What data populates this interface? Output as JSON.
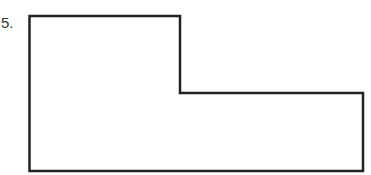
{
  "problem": {
    "number_label": "5."
  },
  "figure": {
    "type": "L-shaped polygon outline",
    "stroke_color": "#222222",
    "fill_color": "#ffffff",
    "stroke_width": 2.5,
    "points": "29.5,16 180,16 180,93 363,93 363,171 29.5,171"
  }
}
